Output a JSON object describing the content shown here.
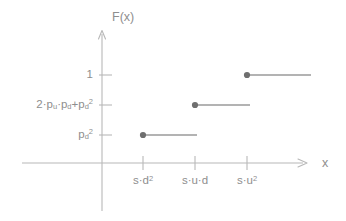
{
  "chart_data": {
    "type": "line",
    "subtype": "step-cdf",
    "title": "",
    "xlabel": "x",
    "ylabel": "F(x)",
    "grid": false,
    "legend": null,
    "x_tick_labels": [
      "s·d²",
      "s·u·d",
      "s·u²"
    ],
    "y_tick_labels": [
      "pₖ²",
      "2·pᵤ·pₖ+pₖ²",
      "1"
    ],
    "x_ticks": [
      {
        "label_html": "s·d<sup>2</sup>",
        "plain": "s·d²",
        "px": 143
      },
      {
        "label_html": "s·u·d",
        "plain": "s·u·d",
        "px": 195
      },
      {
        "label_html": "s·u<sup>2</sup>",
        "plain": "s·u²",
        "px": 247
      }
    ],
    "y_ticks": [
      {
        "label_html": "p<sub>d</sub><sup>2</sup>",
        "plain": "p_d^2",
        "px": 135
      },
      {
        "label_html": "2·p<sub>u</sub>·p<sub>d</sub>+p<sub>d</sub><sup>2</sup>",
        "plain": "2*p_u*p_d+p_d^2",
        "px": 105
      },
      {
        "label_html": "1",
        "plain": "1",
        "px": 75
      }
    ],
    "steps": [
      {
        "x_label": "s·d²",
        "y_label": "p_d^2",
        "x_px": 143,
        "y_px": 135,
        "x_end_px": 197,
        "closed_left": true
      },
      {
        "x_label": "s·u·d",
        "y_label": "2*p_u*p_d+p_d^2",
        "x_px": 195,
        "y_px": 105,
        "x_end_px": 250,
        "closed_left": true
      },
      {
        "x_label": "s·u²",
        "y_label": "1",
        "x_px": 247,
        "y_px": 75,
        "x_end_px": 311,
        "closed_left": true
      }
    ],
    "colors": {
      "axis": "#b4b4b4",
      "text": "#8e8e8e",
      "step_line": "#9a9a9a",
      "marker": "#6f6f6f",
      "background": "#ffffff"
    },
    "axes_geometry": {
      "y_axis_x_px": 102,
      "y_axis_top_px": 30,
      "y_axis_bottom_px": 211,
      "x_axis_y_px": 163,
      "x_axis_left_px": 22,
      "x_axis_right_px": 307
    }
  },
  "labels": {
    "y_axis_title": "F(x)",
    "x_axis_title": "x",
    "y1": "1",
    "y2_html": "2·p",
    "y3_html": "p",
    "sub_u": "u",
    "sub_d": "d",
    "sup_2": "2",
    "mid_dot": "·",
    "plus": "+",
    "s": "s",
    "u": "u",
    "d": "d"
  }
}
